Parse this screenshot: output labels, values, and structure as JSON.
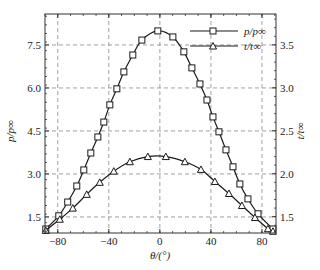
{
  "chart_data": {
    "type": "line",
    "title": "",
    "xlabel": "θ/(°)",
    "ylabel_left": "p/p∞",
    "ylabel_right": "t/t∞",
    "xlim": [
      -90,
      91
    ],
    "ylim_left": [
      0.94,
      8.58
    ],
    "ylim_right": [
      1.31,
      3.86
    ],
    "x_ticks": [
      -80,
      -40,
      0,
      40,
      80
    ],
    "x_tick_labels": [
      "−80",
      "−40",
      "0",
      "40",
      "80"
    ],
    "y_left_ticks": [
      1.5,
      3.0,
      4.5,
      6.0,
      7.5
    ],
    "y_left_tick_labels": [
      "1.5",
      "3.0",
      "4.5",
      "6.0",
      "7.5"
    ],
    "y_right_ticks": [
      1.5,
      2.0,
      2.5,
      3.0,
      3.5
    ],
    "y_right_tick_labels": [
      "1.5",
      "2.0",
      "2.5",
      "3.0",
      "3.5"
    ],
    "grid": true,
    "grid_style": "dashed",
    "legend_position": "upper right",
    "series": [
      {
        "name": "p/p∞",
        "axis": "left",
        "marker": "square",
        "x": [
          -89.4,
          -79.2,
          -72.2,
          -65.1,
          -59.6,
          -54.1,
          -48.6,
          -43.9,
          -39.2,
          -33.7,
          -28.2,
          -21.2,
          -14.1,
          -1.6,
          10.2,
          18.8,
          25.1,
          31.4,
          36.9,
          41.6,
          46.3,
          51.8,
          57.3,
          62.7,
          69.0,
          76.9,
          88.6
        ],
        "values": [
          1.08,
          1.54,
          2.02,
          2.58,
          3.14,
          3.73,
          4.29,
          4.81,
          5.41,
          5.97,
          6.56,
          7.15,
          7.67,
          7.99,
          7.78,
          7.26,
          6.7,
          6.14,
          5.58,
          4.99,
          4.47,
          3.84,
          3.25,
          2.65,
          2.13,
          1.61,
          1.08
        ]
      },
      {
        "name": "t/t∞",
        "axis": "right",
        "marker": "triangle",
        "x": [
          -89.4,
          -78.4,
          -68.2,
          -57.3,
          -47.1,
          -36.1,
          -23.5,
          -9.4,
          4.7,
          19.6,
          32.2,
          43.1,
          54.1,
          64.3,
          74.5,
          84.7,
          88.6
        ],
        "values": [
          1.34,
          1.47,
          1.6,
          1.76,
          1.9,
          2.03,
          2.14,
          2.2,
          2.2,
          2.14,
          2.05,
          1.91,
          1.77,
          1.63,
          1.49,
          1.36,
          1.33
        ]
      }
    ]
  },
  "legend": {
    "items": [
      {
        "label": "p/p∞",
        "marker": "square"
      },
      {
        "label": "t/t∞",
        "marker": "triangle"
      }
    ]
  },
  "colors": {
    "line": "#1a1a1a",
    "grid": "#888888",
    "axis": "#333333",
    "background": "#ffffff"
  }
}
